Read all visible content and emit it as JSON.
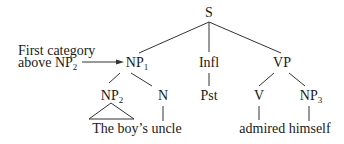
{
  "annotation": {
    "line1": "First category",
    "line2_prefix": "above NP",
    "line2_sub": "2"
  },
  "nodes": {
    "S": "S",
    "NP1": {
      "base": "NP",
      "sub": "1"
    },
    "Infl": "Infl",
    "VP": "VP",
    "NP2": {
      "base": "NP",
      "sub": "2"
    },
    "N": "N",
    "Pst": "Pst",
    "V": "V",
    "NP3": {
      "base": "NP",
      "sub": "3"
    }
  },
  "leaves": {
    "subject": "The boy’s uncle",
    "predicate": "admired himself"
  }
}
